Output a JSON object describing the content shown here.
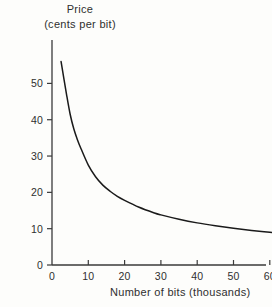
{
  "chart_data": {
    "type": "line",
    "title": "",
    "ylabel": "Price",
    "ylabel_line1": "Price",
    "ylabel_line2": "(cents per bit)",
    "xlabel": "Number of bits (thousands)",
    "xlim": [
      0,
      78
    ],
    "ylim": [
      0,
      58
    ],
    "grid": false,
    "legend": false,
    "xticks": [
      0,
      10,
      20,
      30,
      40,
      50,
      60,
      70
    ],
    "xtick_labels": [
      "0",
      "10",
      "20",
      "30",
      "40",
      "50",
      "60",
      "70"
    ],
    "yticks": [
      0,
      10,
      20,
      30,
      40,
      50
    ],
    "ytick_labels": [
      "0",
      "10",
      "20",
      "30",
      "40",
      "50"
    ],
    "series": [
      {
        "name": "Price per bit",
        "x": [
          2.5,
          4,
          5,
          6,
          7,
          8,
          10,
          12,
          14,
          16,
          18,
          20,
          24,
          28,
          30,
          35,
          40,
          45,
          50,
          55,
          60,
          65,
          70,
          74
        ],
        "y": [
          56,
          47,
          41.5,
          37.5,
          34.5,
          32,
          27.5,
          24.3,
          22,
          20.3,
          18.9,
          17.8,
          15.9,
          14.4,
          13.8,
          12.6,
          11.6,
          10.8,
          10.1,
          9.5,
          9.0,
          8.5,
          8.1,
          7.8
        ]
      }
    ],
    "line_color": "#1a1a1a",
    "axis_color": "#3a3a3a",
    "background_color": "#fdfdfb"
  },
  "axes": {
    "y_axis_name": "price-axis",
    "x_axis_name": "bits-axis"
  }
}
